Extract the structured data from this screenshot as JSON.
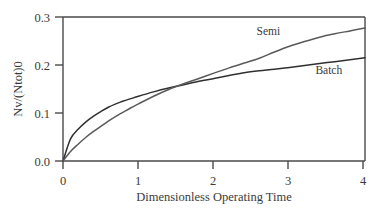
{
  "chart_data": {
    "type": "line",
    "title": "",
    "subtitle": "",
    "xlabel": "Dimensionless Operating Time",
    "ylabel": "Nv/(Ntot)0",
    "xlim": [
      0,
      4
    ],
    "ylim": [
      0,
      0.3
    ],
    "xticks": [
      "0",
      "1",
      "2",
      "3",
      "4"
    ],
    "xtick_values": [
      0,
      1,
      2,
      3,
      4
    ],
    "yticks": [
      "0.0",
      "0.1",
      "0.2",
      "0.3"
    ],
    "ytick_values": [
      0.0,
      0.1,
      0.2,
      0.3
    ],
    "grid": false,
    "legend_position": "inline-annotation",
    "annotations": [
      {
        "text": "Semi",
        "x": 2.72,
        "y": 0.262
      },
      {
        "text": "Batch",
        "x": 3.52,
        "y": 0.181
      }
    ],
    "series": [
      {
        "name": "Batch",
        "color": "#303030",
        "x": [
          0.0,
          0.1,
          0.2,
          0.3,
          0.4,
          0.5,
          0.6,
          0.7,
          0.8,
          0.9,
          1.0,
          1.2,
          1.4,
          1.6,
          1.8,
          2.0,
          2.2,
          2.4,
          2.6,
          2.8,
          3.0,
          3.2,
          3.4,
          3.6,
          3.8,
          4.0
        ],
        "values": [
          0.0,
          0.046,
          0.066,
          0.081,
          0.093,
          0.103,
          0.112,
          0.119,
          0.125,
          0.13,
          0.135,
          0.144,
          0.152,
          0.159,
          0.166,
          0.172,
          0.178,
          0.184,
          0.188,
          0.191,
          0.195,
          0.199,
          0.203,
          0.207,
          0.211,
          0.215
        ]
      },
      {
        "name": "Semi",
        "color": "#5a5a5a",
        "x": [
          0.0,
          0.1,
          0.2,
          0.3,
          0.4,
          0.5,
          0.6,
          0.7,
          0.8,
          0.9,
          1.0,
          1.2,
          1.4,
          1.6,
          1.8,
          2.0,
          2.2,
          2.4,
          2.6,
          2.8,
          3.0,
          3.2,
          3.4,
          3.6,
          3.8,
          4.0
        ],
        "values": [
          0.0,
          0.02,
          0.035,
          0.049,
          0.061,
          0.072,
          0.083,
          0.093,
          0.102,
          0.111,
          0.119,
          0.135,
          0.149,
          0.161,
          0.172,
          0.183,
          0.194,
          0.204,
          0.214,
          0.227,
          0.239,
          0.249,
          0.258,
          0.265,
          0.271,
          0.277
        ]
      }
    ]
  },
  "axes": {
    "frame_color": "#4a4a4a",
    "background": "#ffffff"
  }
}
